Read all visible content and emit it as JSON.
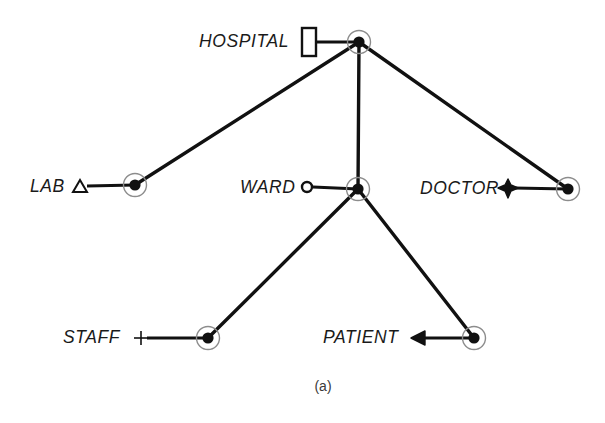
{
  "figure": {
    "caption": "(a)",
    "caption_x": 323,
    "caption_y": 386,
    "background_color": "#ffffff",
    "stroke_color": "#111111"
  },
  "nodes": [
    {
      "id": "hospital",
      "label": "HOSPITAL",
      "symbol": "rectangle-icon",
      "node_x": 359,
      "node_y": 42,
      "symbol_x": 308,
      "symbol_y": 42,
      "label_x": 199,
      "label_y": 41,
      "stub_from_x": 316,
      "stub_to_x": 359
    },
    {
      "id": "lab",
      "label": "LAB",
      "symbol": "triangle-outline-icon",
      "node_x": 135,
      "node_y": 185,
      "symbol_x": 80,
      "symbol_y": 187,
      "label_x": 30,
      "label_y": 186,
      "stub_from_x": 87,
      "stub_to_x": 135
    },
    {
      "id": "ward",
      "label": "WARD",
      "symbol": "circle-outline-icon",
      "node_x": 358,
      "node_y": 189,
      "symbol_x": 307,
      "symbol_y": 187,
      "label_x": 240,
      "label_y": 187,
      "stub_from_x": 313,
      "stub_to_x": 358
    },
    {
      "id": "doctor",
      "label": "DOCTOR",
      "symbol": "star-icon",
      "node_x": 568,
      "node_y": 189,
      "symbol_x": 508,
      "symbol_y": 188,
      "label_x": 420,
      "label_y": 188,
      "stub_from_x": 514,
      "stub_to_x": 568
    },
    {
      "id": "staff",
      "label": "STAFF",
      "symbol": "plus-icon",
      "node_x": 208,
      "node_y": 338,
      "symbol_x": 141,
      "symbol_y": 338,
      "label_x": 63,
      "label_y": 337,
      "stub_from_x": 147,
      "stub_to_x": 208
    },
    {
      "id": "patient",
      "label": "PATIENT",
      "symbol": "filled-triangle-icon",
      "node_x": 474,
      "node_y": 338,
      "symbol_x": 420,
      "symbol_y": 338,
      "label_x": 323,
      "label_y": 337,
      "stub_from_x": 424,
      "stub_to_x": 474
    }
  ],
  "edges": [
    {
      "id": "hospital-lab",
      "from": "hospital",
      "to": "lab",
      "x1": 359,
      "y1": 42,
      "x2": 135,
      "y2": 185
    },
    {
      "id": "hospital-ward",
      "from": "hospital",
      "to": "ward",
      "x1": 359,
      "y1": 42,
      "x2": 358,
      "y2": 189
    },
    {
      "id": "hospital-doctor",
      "from": "hospital",
      "to": "doctor",
      "x1": 359,
      "y1": 42,
      "x2": 568,
      "y2": 189
    },
    {
      "id": "ward-staff",
      "from": "ward",
      "to": "staff",
      "x1": 358,
      "y1": 189,
      "x2": 208,
      "y2": 338
    },
    {
      "id": "ward-patient",
      "from": "ward",
      "to": "patient",
      "x1": 358,
      "y1": 189,
      "x2": 474,
      "y2": 338
    }
  ]
}
